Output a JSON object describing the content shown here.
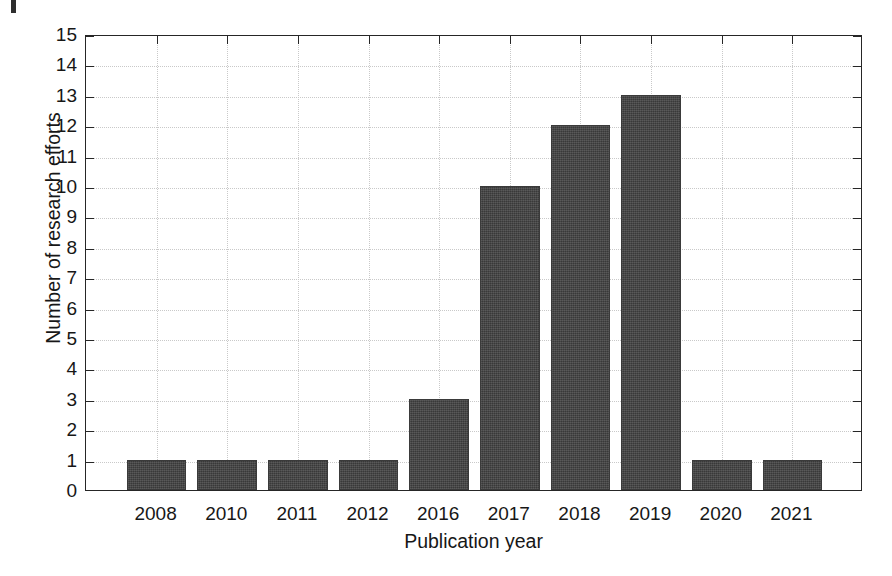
{
  "figure": {
    "artifact_name": "scan-edge-mark"
  },
  "chart_data": {
    "type": "bar",
    "title": "",
    "xlabel": "Publication year",
    "ylabel": "Number of research efforts",
    "categories": [
      "2008",
      "2010",
      "2011",
      "2012",
      "2016",
      "2017",
      "2018",
      "2019",
      "2020",
      "2021"
    ],
    "values": [
      1,
      1,
      1,
      1,
      3,
      10,
      12,
      13,
      1,
      1
    ],
    "ylim": [
      0,
      15
    ],
    "ytick_labels": [
      "0",
      "1",
      "2",
      "3",
      "4",
      "5",
      "6",
      "7",
      "8",
      "9",
      "10",
      "11",
      "12",
      "13",
      "14",
      "15"
    ],
    "ytick_values": [
      0,
      1,
      2,
      3,
      4,
      5,
      6,
      7,
      8,
      9,
      10,
      11,
      12,
      13,
      14,
      15
    ],
    "grid": true,
    "grid_axis": "both",
    "legend": false,
    "legend_position": "none",
    "bar_color": "#414141",
    "grid_color": "#c9c9c9",
    "axis_color": "#262626",
    "background_color": "#ffffff"
  }
}
